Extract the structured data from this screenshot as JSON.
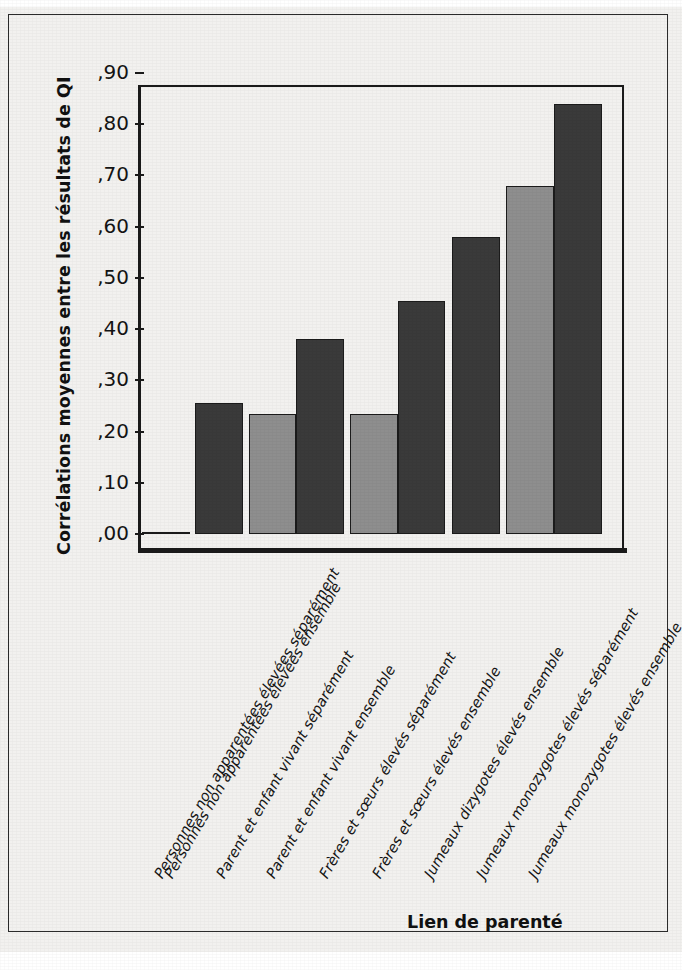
{
  "figure": {
    "background_color": "#f2f1ef",
    "frame_color": "#2b2b2b"
  },
  "chart_data": {
    "type": "bar",
    "title": "",
    "xlabel": "Lien de parenté",
    "ylabel": "Corrélations moyennes entre les résultats de QI",
    "ylim": [
      0.0,
      0.9
    ],
    "ytick_labels": [
      ",00",
      ",10",
      ",20",
      ",30",
      ",40",
      ",50",
      ",60",
      ",70",
      ",80",
      ",90"
    ],
    "ytick_values": [
      0.0,
      0.1,
      0.2,
      0.3,
      0.4,
      0.5,
      0.6,
      0.7,
      0.8,
      0.9
    ],
    "grid": false,
    "legend": false,
    "decimal_separator": ",",
    "categories": [
      "Personnes non apparentées élevées séparément",
      "Personnes non apparentées élevées ensemble",
      "Parent et enfant vivant séparément",
      "Parent et enfant vivant ensemble",
      "Frères et sœurs élevés séparément",
      "Frères et sœurs élevés ensemble",
      "Jumeaux dizygotes élevés ensemble",
      "Jumeaux monozygotes élevés séparément",
      "Jumeaux monozygotes élevés ensemble"
    ],
    "values": [
      0.0,
      0.255,
      0.235,
      0.38,
      0.235,
      0.455,
      0.58,
      0.68,
      0.84
    ],
    "bar_colors": [
      "#8e8e8e",
      "#3a3a3a",
      "#8e8e8e",
      "#3a3a3a",
      "#8e8e8e",
      "#3a3a3a",
      "#3a3a3a",
      "#8e8e8e",
      "#3a3a3a"
    ],
    "bar_edge_color": "#1b1b1b",
    "palette": {
      "dark": "#3a3a3a",
      "light": "#8e8e8e"
    }
  }
}
